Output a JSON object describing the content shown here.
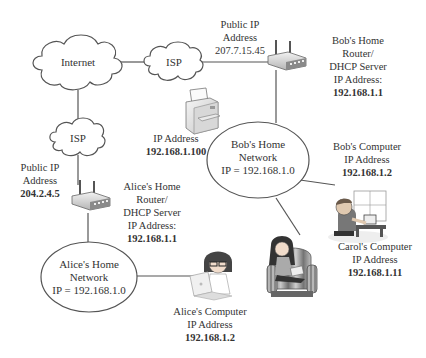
{
  "diagram": {
    "type": "network-topology",
    "clouds": {
      "internet": {
        "label": "Internet"
      },
      "isp_top": {
        "label": "ISP"
      },
      "isp_left": {
        "label": "ISP"
      }
    },
    "bob_public_ip": {
      "line1": "Public IP",
      "line2": "Address",
      "line3": "207.7.15.45"
    },
    "alice_public_ip": {
      "line1": "Public IP",
      "line2": "Address",
      "line3": "204.2.4.5"
    },
    "bob_router": {
      "line1": "Bob's Home",
      "line2": "Router/",
      "line3": "DHCP Server",
      "line4": "IP Address:",
      "ip": "192.168.1.1"
    },
    "alice_router": {
      "line1": "Alice's Home",
      "line2": "Router/",
      "line3": "DHCP Server",
      "line4": "IP Address:",
      "ip": "192.168.1.1"
    },
    "printer": {
      "line1": "IP Address",
      "ip": "192.168.1.100"
    },
    "bob_network": {
      "line1": "Bob's Home",
      "line2": "Network",
      "line3": "IP = 192.168.1.0"
    },
    "alice_network": {
      "line1": "Alice's Home",
      "line2": "Network",
      "line3": "IP = 192.168.1.0"
    },
    "bob_computer": {
      "line1": "Bob's Computer",
      "line2": "IP Address",
      "ip": "192.168.1.2"
    },
    "carol_computer": {
      "line1": "Carol's Computer",
      "line2": "IP Address",
      "ip": "192.168.1.11"
    },
    "alice_computer": {
      "line1": "Alice's Computer",
      "line2": "IP Address",
      "ip": "192.168.1.2"
    },
    "colors": {
      "line": "#555555",
      "cloud_fill": "#ffffff",
      "cloud_stroke": "#555555",
      "text": "#333333"
    }
  }
}
